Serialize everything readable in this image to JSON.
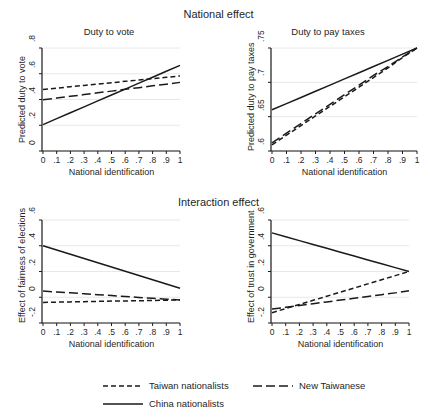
{
  "figure": {
    "supertitle_top": "National effect",
    "supertitle_bottom": "Interaction effect"
  },
  "legend": {
    "items": [
      {
        "label": "Taiwan nationalists",
        "style": "short-dash",
        "color": "#1a1a1a"
      },
      {
        "label": "New Taiwanese",
        "style": "long-dash",
        "color": "#1a1a1a"
      },
      {
        "label": "China nationalists",
        "style": "solid",
        "color": "#1a1a1a"
      }
    ]
  },
  "chart_data": [
    {
      "type": "line",
      "title": "Duty to vote",
      "xlabel": "National identification",
      "ylabel": "Predicted duty to vote",
      "x": [
        0,
        0.1,
        0.2,
        0.3,
        0.4,
        0.5,
        0.6,
        0.7,
        0.8,
        0.9,
        1
      ],
      "xticklabels": [
        "0",
        ".1",
        ".2",
        ".3",
        ".4",
        ".5",
        ".6",
        ".7",
        ".8",
        ".9",
        "1"
      ],
      "xlim": [
        0,
        1
      ],
      "ylim": [
        0,
        0.8
      ],
      "yticks": [
        0,
        0.2,
        0.4,
        0.6,
        0.8
      ],
      "yticklabels": [
        "0",
        ".2",
        ".4",
        ".6",
        ".8"
      ],
      "grid": true,
      "series": [
        {
          "name": "Taiwan nationalists",
          "style": "short-dash",
          "values": [
            0.478,
            0.488,
            0.499,
            0.509,
            0.52,
            0.53,
            0.541,
            0.551,
            0.562,
            0.572,
            0.583
          ]
        },
        {
          "name": "New Taiwanese",
          "style": "long-dash",
          "values": [
            0.398,
            0.411,
            0.425,
            0.438,
            0.452,
            0.465,
            0.479,
            0.492,
            0.506,
            0.519,
            0.533
          ]
        },
        {
          "name": "China nationalists",
          "style": "solid",
          "values": [
            0.205,
            0.251,
            0.297,
            0.343,
            0.389,
            0.435,
            0.481,
            0.527,
            0.573,
            0.619,
            0.665
          ]
        }
      ]
    },
    {
      "type": "line",
      "title": "Duty to pay taxes",
      "xlabel": "National identification",
      "ylabel": "Predicted duty to pay taxes",
      "x": [
        0,
        0.1,
        0.2,
        0.3,
        0.4,
        0.5,
        0.6,
        0.7,
        0.8,
        0.9,
        1
      ],
      "xticklabels": [
        "0",
        ".1",
        ".2",
        ".3",
        ".4",
        ".5",
        ".6",
        ".7",
        ".8",
        ".9",
        "1"
      ],
      "xlim": [
        0,
        1
      ],
      "ylim": [
        0.6,
        0.75
      ],
      "yticks": [
        0.6,
        0.65,
        0.7,
        0.75
      ],
      "yticklabels": [
        ".6",
        ".65",
        ".7",
        ".75"
      ],
      "grid": true,
      "series": [
        {
          "name": "Taiwan nationalists",
          "style": "short-dash",
          "values": [
            0.609,
            0.623,
            0.637,
            0.651,
            0.665,
            0.679,
            0.693,
            0.707,
            0.721,
            0.736,
            0.75
          ]
        },
        {
          "name": "New Taiwanese",
          "style": "long-dash",
          "values": [
            0.612,
            0.626,
            0.64,
            0.654,
            0.668,
            0.682,
            0.696,
            0.71,
            0.723,
            0.737,
            0.75
          ]
        },
        {
          "name": "China nationalists",
          "style": "solid",
          "values": [
            0.66,
            0.669,
            0.678,
            0.687,
            0.696,
            0.705,
            0.714,
            0.723,
            0.732,
            0.741,
            0.75
          ]
        }
      ]
    },
    {
      "type": "line",
      "title": "",
      "xlabel": "National identification",
      "ylabel": "Effect of fairness of elections",
      "x": [
        0,
        0.1,
        0.2,
        0.3,
        0.4,
        0.5,
        0.6,
        0.7,
        0.8,
        0.9,
        1
      ],
      "xticklabels": [
        "0",
        ".1",
        ".2",
        ".3",
        ".4",
        ".5",
        ".6",
        ".7",
        ".8",
        ".9",
        "1"
      ],
      "xlim": [
        0,
        1
      ],
      "ylim": [
        -0.2,
        0.6
      ],
      "yticks": [
        -0.2,
        0,
        0.2,
        0.4,
        0.6
      ],
      "yticklabels": [
        "-.2",
        "0",
        ".2",
        ".4",
        ".6"
      ],
      "grid": true,
      "series": [
        {
          "name": "Taiwan nationalists",
          "style": "short-dash",
          "values": [
            -0.04,
            -0.038,
            -0.036,
            -0.034,
            -0.032,
            -0.03,
            -0.029,
            -0.027,
            -0.025,
            -0.023,
            -0.021
          ]
        },
        {
          "name": "New Taiwanese",
          "style": "long-dash",
          "values": [
            0.048,
            0.041,
            0.034,
            0.027,
            0.02,
            0.013,
            0.006,
            -0.001,
            -0.008,
            -0.015,
            -0.022
          ]
        },
        {
          "name": "China nationalists",
          "style": "solid",
          "values": [
            0.4,
            0.367,
            0.334,
            0.301,
            0.268,
            0.235,
            0.202,
            0.169,
            0.136,
            0.103,
            0.07
          ]
        }
      ]
    },
    {
      "type": "line",
      "title": "",
      "xlabel": "National identification",
      "ylabel": "Effect of trust in government",
      "x": [
        0,
        0.1,
        0.2,
        0.3,
        0.4,
        0.5,
        0.6,
        0.7,
        0.8,
        0.9,
        1
      ],
      "xticklabels": [
        "0",
        ".1",
        ".2",
        ".3",
        ".4",
        ".5",
        ".6",
        ".7",
        ".8",
        ".9",
        "1"
      ],
      "xlim": [
        0,
        1
      ],
      "ylim": [
        -0.2,
        0.6
      ],
      "yticks": [
        -0.2,
        0,
        0.2,
        0.4,
        0.6
      ],
      "yticklabels": [
        "-.2",
        "0",
        ".2",
        ".4",
        ".6"
      ],
      "grid": true,
      "series": [
        {
          "name": "Taiwan nationalists",
          "style": "short-dash",
          "values": [
            -0.12,
            -0.088,
            -0.056,
            -0.024,
            0.008,
            0.04,
            0.072,
            0.104,
            0.136,
            0.168,
            0.2
          ]
        },
        {
          "name": "New Taiwanese",
          "style": "long-dash",
          "values": [
            -0.092,
            -0.078,
            -0.064,
            -0.05,
            -0.036,
            -0.022,
            -0.008,
            0.006,
            0.02,
            0.034,
            0.05
          ]
        },
        {
          "name": "China nationalists",
          "style": "solid",
          "values": [
            0.5,
            0.47,
            0.44,
            0.41,
            0.38,
            0.35,
            0.32,
            0.29,
            0.26,
            0.23,
            0.2
          ]
        }
      ]
    }
  ]
}
